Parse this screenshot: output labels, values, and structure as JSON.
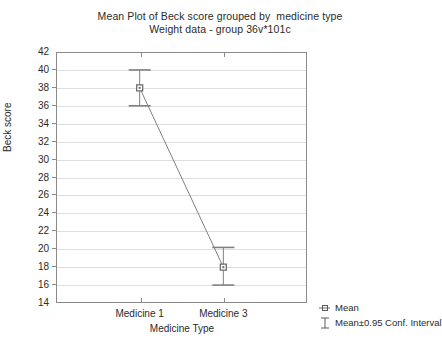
{
  "chart_data": {
    "type": "line",
    "title": "Mean Plot of Beck score grouped by  medicine type",
    "subtitle": "Weight data - group 36v*101c",
    "xlabel": "Medicine Type",
    "ylabel": "Beck score",
    "categories": [
      "Medicine 1",
      "Medicine 3"
    ],
    "values": [
      38,
      18
    ],
    "error_upper": [
      40,
      20.2
    ],
    "error_lower": [
      36,
      16
    ],
    "ylim": [
      14,
      42
    ],
    "ytick_step": 2,
    "yticks": [
      42,
      40,
      38,
      36,
      34,
      32,
      30,
      28,
      26,
      24,
      22,
      20,
      18,
      16,
      14
    ],
    "grid": true,
    "legend_position": "bottom-right",
    "series": [
      {
        "name": "Mean",
        "values": [
          38,
          18
        ]
      },
      {
        "name": "Mean±0.95 Conf. Interval",
        "upper": [
          40,
          20.2
        ],
        "lower": [
          36,
          16
        ]
      }
    ],
    "colors": {
      "line": "#808080",
      "marker": "#6e6e6e",
      "error_bar": "#808080",
      "grid": "#dedede",
      "frame": "#8a8a8a",
      "text": "#2a2a2a",
      "background": "#ffffff"
    }
  },
  "legend": {
    "items": [
      {
        "label": "Mean",
        "glyph": "mean-marker-icon"
      },
      {
        "label": "Mean±0.95 Conf. Interval",
        "glyph": "conf-interval-icon"
      }
    ]
  }
}
